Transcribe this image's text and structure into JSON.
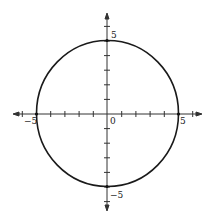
{
  "chart_data": {
    "type": "line",
    "title": "",
    "equation": "x^2 + y^2 = 25",
    "center": [
      0,
      0
    ],
    "radius": 5,
    "xlabel": "",
    "ylabel": "",
    "xlim": [
      -6.5,
      6.5
    ],
    "ylim": [
      -6.5,
      6.5
    ],
    "x_ticks": [
      -6,
      -5,
      -4,
      -3,
      -2,
      -1,
      0,
      1,
      2,
      3,
      4,
      5,
      6
    ],
    "y_ticks": [
      -6,
      -5,
      -4,
      -3,
      -2,
      -1,
      0,
      1,
      2,
      3,
      4,
      5,
      6
    ],
    "tick_labels": {
      "x_neg": "−5",
      "x_pos": "5",
      "origin": "0",
      "y_pos": "5",
      "y_neg": "−5"
    },
    "marked_points": [
      [
        -5,
        0
      ],
      [
        5,
        0
      ],
      [
        0,
        5
      ],
      [
        0,
        -5
      ]
    ],
    "grid": false,
    "legend": null,
    "colors": {
      "curve": "#1a1a1a",
      "axes": "#333333"
    }
  }
}
